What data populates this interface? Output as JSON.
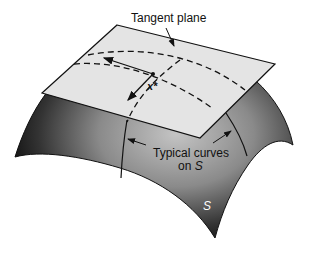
{
  "figure": {
    "labels": {
      "tangent_plane": "Tangent plane",
      "point": "x*",
      "curves_line1": "Typical curves",
      "curves_line2": "on ",
      "curves_line2_italic": "S",
      "surface": "S"
    },
    "colors": {
      "surface_dark": "#111111",
      "surface_mid": "#777777",
      "surface_light": "#b8b8b8",
      "plane_fill": "#e6e6e6",
      "stroke": "#111111",
      "background": "#ffffff"
    }
  }
}
